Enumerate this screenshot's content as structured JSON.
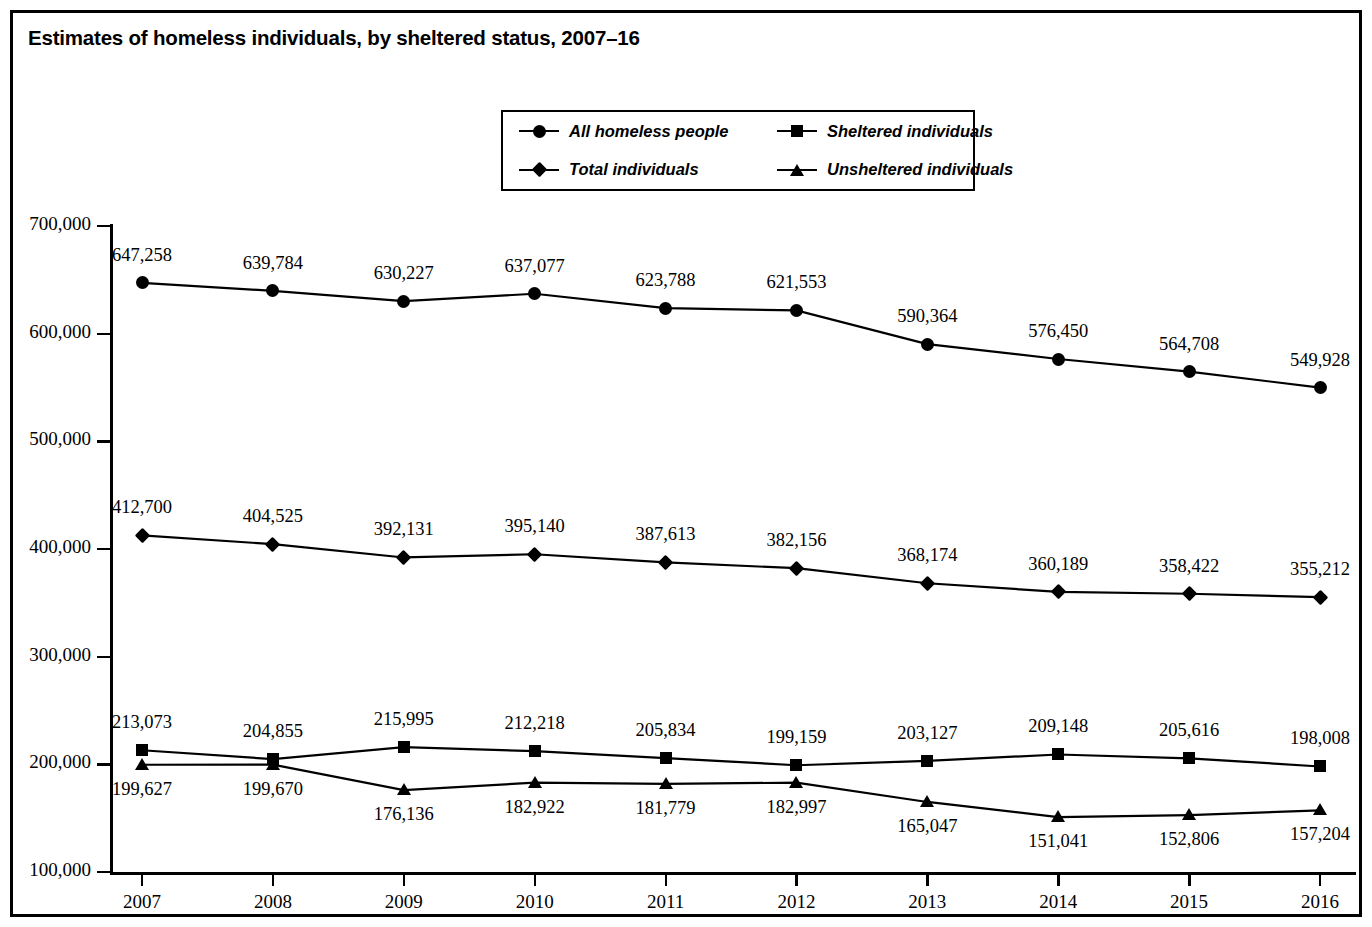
{
  "title": "Estimates of homeless individuals, by sheltered status, 2007–16",
  "legend": {
    "position": "top-center",
    "items": [
      {
        "label": "All homeless people",
        "marker": "circle-marker-icon"
      },
      {
        "label": "Sheltered individuals",
        "marker": "square-marker-icon"
      },
      {
        "label": "Total individuals",
        "marker": "diamond-marker-icon"
      },
      {
        "label": "Unsheltered individuals",
        "marker": "triangle-marker-icon"
      }
    ]
  },
  "axes": {
    "y_ticks": [
      "100,000",
      "200,000",
      "300,000",
      "400,000",
      "500,000",
      "600,000",
      "700,000"
    ],
    "x_ticks": [
      "2007",
      "2008",
      "2009",
      "2010",
      "2011",
      "2012",
      "2013",
      "2014",
      "2015",
      "2016"
    ]
  },
  "colors": {
    "ink": "#000000",
    "background": "#ffffff"
  },
  "chart_data": {
    "type": "line",
    "title": "Estimates of homeless individuals, by sheltered status, 2007–16",
    "xlabel": "",
    "ylabel": "",
    "x": [
      2007,
      2008,
      2009,
      2010,
      2011,
      2012,
      2013,
      2014,
      2015,
      2016
    ],
    "categories": [
      "2007",
      "2008",
      "2009",
      "2010",
      "2011",
      "2012",
      "2013",
      "2014",
      "2015",
      "2016"
    ],
    "ylim": [
      100000,
      700000
    ],
    "ytick_values": [
      100000,
      200000,
      300000,
      400000,
      500000,
      600000,
      700000
    ],
    "grid": false,
    "legend_position": "top-center",
    "series": [
      {
        "name": "All homeless people",
        "marker": "circle",
        "values": [
          647258,
          639784,
          630227,
          637077,
          623788,
          621553,
          590364,
          576450,
          564708,
          549928
        ],
        "labels": [
          "647,258",
          "639,784",
          "630,227",
          "637,077",
          "623,788",
          "621,553",
          "590,364",
          "576,450",
          "564,708",
          "549,928"
        ],
        "label_position": "above"
      },
      {
        "name": "Total individuals",
        "marker": "diamond",
        "values": [
          412700,
          404525,
          392131,
          395140,
          387613,
          382156,
          368174,
          360189,
          358422,
          355212
        ],
        "labels": [
          "412,700",
          "404,525",
          "392,131",
          "395,140",
          "387,613",
          "382,156",
          "368,174",
          "360,189",
          "358,422",
          "355,212"
        ],
        "label_position": "above"
      },
      {
        "name": "Sheltered individuals",
        "marker": "square",
        "values": [
          213073,
          204855,
          215995,
          212218,
          205834,
          199159,
          203127,
          209148,
          205616,
          198008
        ],
        "labels": [
          "213,073",
          "204,855",
          "215,995",
          "212,218",
          "205,834",
          "199,159",
          "203,127",
          "209,148",
          "205,616",
          "198,008"
        ],
        "label_position": "above"
      },
      {
        "name": "Unsheltered individuals",
        "marker": "triangle",
        "values": [
          199627,
          199670,
          176136,
          182922,
          181779,
          182997,
          165047,
          151041,
          152806,
          157204
        ],
        "labels": [
          "199,627",
          "199,670",
          "176,136",
          "182,922",
          "181,779",
          "182,997",
          "165,047",
          "151,041",
          "152,806",
          "157,204"
        ],
        "label_position": "below"
      }
    ]
  }
}
